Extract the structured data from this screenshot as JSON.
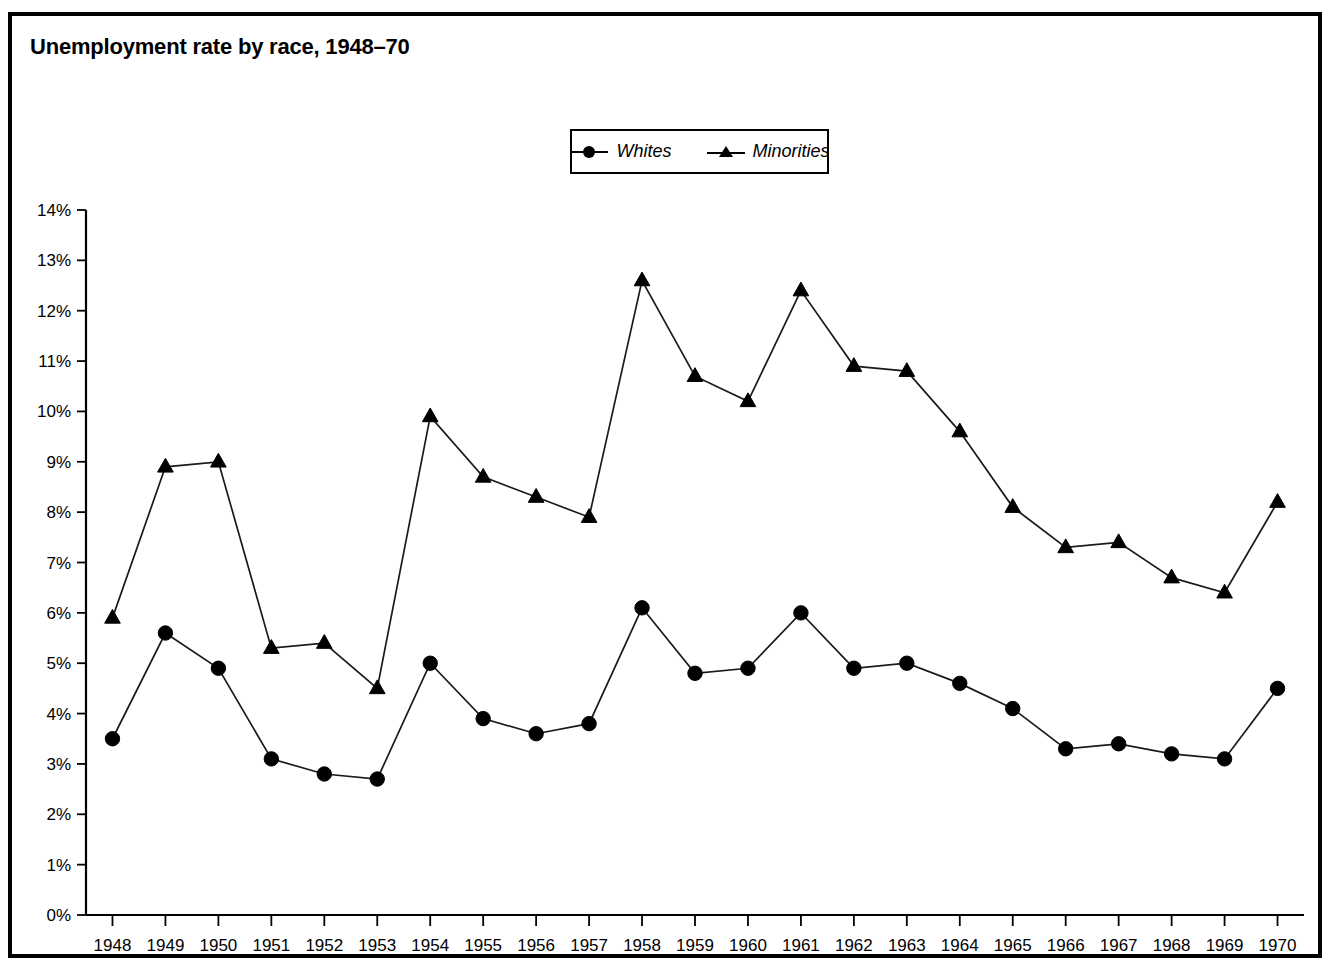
{
  "figure": {
    "title": "Unemployment rate by race, 1948–70",
    "border_color": "#000000",
    "background": "#ffffff"
  },
  "legend": {
    "position": "top-center",
    "entries": [
      {
        "label": "Whites",
        "marker": "circle-marker-icon",
        "color": "#000000"
      },
      {
        "label": "Minorities",
        "marker": "triangle-marker-icon",
        "color": "#000000"
      }
    ]
  },
  "axes": {
    "y_ticks": [
      "0%",
      "1%",
      "2%",
      "3%",
      "4%",
      "5%",
      "6%",
      "7%",
      "8%",
      "9%",
      "10%",
      "11%",
      "12%",
      "13%",
      "14%"
    ],
    "x_ticks": [
      "1948",
      "1949",
      "1950",
      "1951",
      "1952",
      "1953",
      "1954",
      "1955",
      "1956",
      "1957",
      "1958",
      "1959",
      "1960",
      "1961",
      "1962",
      "1963",
      "1964",
      "1965",
      "1966",
      "1967",
      "1968",
      "1969",
      "1970"
    ]
  },
  "chart_data": {
    "type": "line",
    "title": "Unemployment rate by race, 1948–70",
    "xlabel": "",
    "ylabel": "",
    "ylim": [
      0,
      14
    ],
    "ytick_step": 1,
    "ytick_format": "percent",
    "grid": false,
    "legend_position": "top-center",
    "categories": [
      "1948",
      "1949",
      "1950",
      "1951",
      "1952",
      "1953",
      "1954",
      "1955",
      "1956",
      "1957",
      "1958",
      "1959",
      "1960",
      "1961",
      "1962",
      "1963",
      "1964",
      "1965",
      "1966",
      "1967",
      "1968",
      "1969",
      "1970"
    ],
    "series": [
      {
        "name": "Whites",
        "marker": "circle",
        "color": "#000000",
        "values": [
          3.5,
          5.6,
          4.9,
          3.1,
          2.8,
          2.7,
          5.0,
          3.9,
          3.6,
          3.8,
          6.1,
          4.8,
          4.9,
          6.0,
          4.9,
          5.0,
          4.6,
          4.1,
          3.3,
          3.4,
          3.2,
          3.1,
          4.5
        ]
      },
      {
        "name": "Minorities",
        "marker": "triangle",
        "color": "#000000",
        "values": [
          5.9,
          8.9,
          9.0,
          5.3,
          5.4,
          4.5,
          9.9,
          8.7,
          8.3,
          7.9,
          12.6,
          10.7,
          10.2,
          12.4,
          10.9,
          10.8,
          9.6,
          8.1,
          7.3,
          7.4,
          6.7,
          6.4,
          8.2
        ]
      }
    ]
  }
}
